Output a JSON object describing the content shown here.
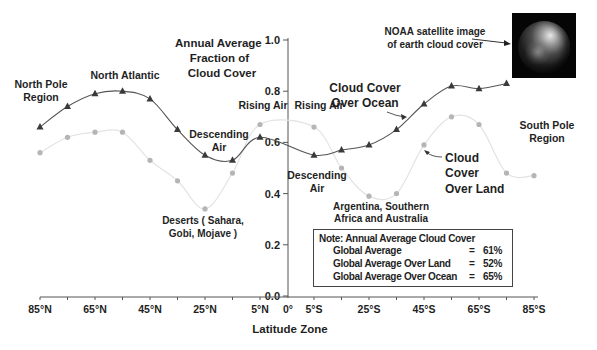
{
  "chart_data": {
    "type": "line",
    "title": "Annual Average Fraction of Cloud Cover",
    "title_lines": [
      "Annual Average",
      "Fraction of",
      "Cloud Cover"
    ],
    "xlabel": "Latitude Zone",
    "ylabel": "Annual Average Fraction of Cloud Cover",
    "ylim": [
      0.0,
      1.0
    ],
    "y_ticks": [
      "0.0",
      "0.2",
      "0.4",
      "0.6",
      "0.8",
      "1.0"
    ],
    "x_tick_labels": [
      "85°N",
      "65°N",
      "45°N",
      "25°N",
      "5°N",
      "0°",
      "5°S",
      "25°S",
      "45°S",
      "65°S",
      "85°S"
    ],
    "grid": false,
    "series": [
      {
        "name": "Cloud Cover Over Ocean",
        "marker": "triangle",
        "color": "#3a3a3a",
        "x": [
          "85°N",
          "75°N",
          "65°N",
          "55°N",
          "45°N",
          "35°N",
          "25°N",
          "15°N",
          "5°N",
          "5°S",
          "15°S",
          "25°S",
          "35°S",
          "45°S",
          "55°S",
          "65°S",
          "75°S"
        ],
        "values": [
          0.66,
          0.74,
          0.79,
          0.8,
          0.77,
          0.65,
          0.55,
          0.53,
          0.62,
          0.55,
          0.57,
          0.59,
          0.65,
          0.75,
          0.82,
          0.81,
          0.83
        ]
      },
      {
        "name": "Cloud Cover Over Land",
        "marker": "circle",
        "color": "#b5b5b5",
        "x": [
          "85°N",
          "75°N",
          "65°N",
          "55°N",
          "45°N",
          "35°N",
          "25°N",
          "15°N",
          "5°N",
          "5°S",
          "15°S",
          "25°S",
          "35°S",
          "45°S",
          "55°S",
          "65°S",
          "75°S",
          "85°S"
        ],
        "values": [
          0.56,
          0.62,
          0.64,
          0.64,
          0.53,
          0.45,
          0.34,
          0.48,
          0.67,
          0.66,
          0.5,
          0.39,
          0.4,
          0.59,
          0.7,
          0.67,
          0.48,
          0.47
        ]
      }
    ],
    "annotations": [
      "North Pole Region",
      "North Atlantic",
      "Rising Air",
      "Rising Air",
      "Descending Air",
      "Descending Air",
      "Deserts ( Sahara, Gobi, Mojave )",
      "Argentina, Southern Africa and Australia",
      "Cloud Cover Over Ocean",
      "Cloud Cover Over Land",
      "South Pole Region",
      "NOAA satellite image of earth cloud cover"
    ]
  },
  "labels": {
    "north_pole": [
      "North Pole",
      "Region"
    ],
    "north_atlantic": "North Atlantic",
    "rising_air_n": "Rising Air",
    "rising_air_s": "Rising Air",
    "descending_air_n": [
      "Descending",
      "Air"
    ],
    "descending_air_s": [
      "Descending",
      "Air"
    ],
    "deserts": [
      "Deserts ( Sahara,",
      "Gobi, Mojave )"
    ],
    "southern": [
      "Argentina, Southern",
      "Africa and Australia"
    ],
    "ocean": [
      "Cloud Cover",
      "Over Ocean"
    ],
    "land": [
      "Cloud",
      "Cover",
      "Over Land"
    ],
    "south_pole": [
      "South Pole",
      "Region"
    ],
    "satellite": [
      "NOAA satellite image",
      "of earth cloud cover"
    ]
  },
  "note": {
    "title": "Note: Annual Average Cloud Cover",
    "rows": [
      {
        "label": "Global Average",
        "eq": "=",
        "value": "61%"
      },
      {
        "label": "Global Average Over Land",
        "eq": "=",
        "value": "52%"
      },
      {
        "label": "Global Average Over Ocean",
        "eq": "=",
        "value": "65%"
      }
    ]
  }
}
